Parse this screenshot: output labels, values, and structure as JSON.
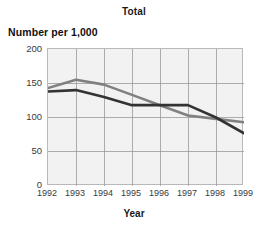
{
  "chart_data": {
    "type": "line",
    "title": "Total",
    "xlabel": "Year",
    "ylabel": "Number per 1,000",
    "categories": [
      "1992",
      "1993",
      "1994",
      "1995",
      "1996",
      "1997",
      "1998",
      "1999"
    ],
    "x": [
      1992,
      1993,
      1994,
      1995,
      1996,
      1997,
      1998,
      1999
    ],
    "series": [
      {
        "name": "series-gray",
        "color": "#808080",
        "values": [
          143,
          155,
          148,
          133,
          118,
          103,
          98,
          93
        ]
      },
      {
        "name": "series-dark",
        "color": "#333333",
        "values": [
          138,
          140,
          130,
          118,
          118,
          118,
          100,
          77
        ]
      }
    ],
    "ylim": [
      0,
      200
    ],
    "yticks": [
      0,
      50,
      100,
      150,
      200
    ],
    "ytick_labels": [
      "0",
      "50",
      "100",
      "150",
      "200"
    ],
    "xlim": [
      1992,
      1999
    ],
    "grid": true,
    "legend": "none",
    "plot_background": "#f2f2f2",
    "grid_color": "#9a9a9a",
    "frame_color": "#b9b9b9"
  }
}
